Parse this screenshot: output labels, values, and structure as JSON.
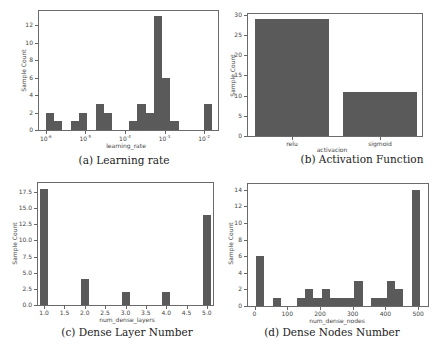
{
  "chart_data": [
    {
      "id": "a",
      "type": "bar",
      "title": "",
      "caption": "(a) Learning rate",
      "xlabel": "learning_rate",
      "ylabel": "Sample Count",
      "xscale": "log",
      "xticks": [
        "10^-6",
        "10^-5",
        "10^-4",
        "10^-3",
        "10^-2"
      ],
      "yticks": [
        0,
        2,
        4,
        6,
        8,
        10,
        12
      ],
      "ylim": [
        0,
        13.6
      ],
      "bins_log10": [
        {
          "x0": -6.0,
          "x1": -5.79,
          "count": 2
        },
        {
          "x0": -5.79,
          "x1": -5.58,
          "count": 1
        },
        {
          "x0": -5.37,
          "x1": -5.16,
          "count": 1
        },
        {
          "x0": -5.16,
          "x1": -4.95,
          "count": 2
        },
        {
          "x0": -4.74,
          "x1": -4.53,
          "count": 3
        },
        {
          "x0": -4.53,
          "x1": -4.32,
          "count": 2
        },
        {
          "x0": -3.9,
          "x1": -3.69,
          "count": 1
        },
        {
          "x0": -3.69,
          "x1": -3.48,
          "count": 3
        },
        {
          "x0": -3.48,
          "x1": -3.27,
          "count": 2
        },
        {
          "x0": -3.27,
          "x1": -3.06,
          "count": 13
        },
        {
          "x0": -3.06,
          "x1": -2.85,
          "count": 6
        },
        {
          "x0": -2.85,
          "x1": -2.64,
          "count": 1
        },
        {
          "x0": -2.0,
          "x1": -1.79,
          "count": 3
        }
      ],
      "grid": false
    },
    {
      "id": "b",
      "type": "bar",
      "caption": "(b) Activation Function",
      "xlabel": "activacion",
      "ylabel": "Sample Count",
      "categories": [
        "relu",
        "sigmoid"
      ],
      "values": [
        29,
        11
      ],
      "yticks": [
        0,
        5,
        10,
        15,
        20,
        25,
        30
      ],
      "ylim": [
        0,
        30
      ],
      "grid": false
    },
    {
      "id": "c",
      "type": "bar",
      "caption": "(c) Dense Layer Number",
      "xlabel": "num_dense_layers",
      "ylabel": "Sample Count",
      "xticks": [
        "1.0",
        "1.5",
        "2.0",
        "2.5",
        "3.0",
        "3.5",
        "4.0",
        "4.5",
        "5.0"
      ],
      "yticks": [
        "0.0",
        "2.5",
        "5.0",
        "7.5",
        "10.0",
        "12.5",
        "15.0",
        "17.5"
      ],
      "x": [
        1,
        2,
        3,
        4,
        5
      ],
      "values": [
        18,
        4,
        2,
        2,
        14
      ],
      "xlim": [
        0.85,
        5.15
      ],
      "ylim": [
        0,
        18.9
      ],
      "grid": false
    },
    {
      "id": "d",
      "type": "bar",
      "caption": "(d) Dense Nodes Number",
      "xlabel": "num_dense_nodes",
      "ylabel": "Sample Count",
      "xticks": [
        "0",
        "100",
        "200",
        "300",
        "400",
        "500"
      ],
      "yticks": [
        0,
        2,
        4,
        6,
        8,
        10,
        12,
        14
      ],
      "xlim": [
        -20,
        530
      ],
      "ylim": [
        0,
        14.7
      ],
      "bins": [
        {
          "x0": 5,
          "x1": 30,
          "count": 6
        },
        {
          "x0": 55,
          "x1": 80,
          "count": 1
        },
        {
          "x0": 130,
          "x1": 155,
          "count": 1
        },
        {
          "x0": 155,
          "x1": 180,
          "count": 2
        },
        {
          "x0": 180,
          "x1": 205,
          "count": 1
        },
        {
          "x0": 205,
          "x1": 230,
          "count": 2
        },
        {
          "x0": 230,
          "x1": 255,
          "count": 1
        },
        {
          "x0": 255,
          "x1": 280,
          "count": 1
        },
        {
          "x0": 280,
          "x1": 305,
          "count": 1
        },
        {
          "x0": 305,
          "x1": 330,
          "count": 3
        },
        {
          "x0": 355,
          "x1": 380,
          "count": 1
        },
        {
          "x0": 380,
          "x1": 405,
          "count": 1
        },
        {
          "x0": 405,
          "x1": 430,
          "count": 3
        },
        {
          "x0": 430,
          "x1": 455,
          "count": 2
        },
        {
          "x0": 480,
          "x1": 505,
          "count": 14
        }
      ],
      "grid": false
    }
  ],
  "colors": {
    "bar": "#5a5a5a",
    "axis": "#6a6a6a",
    "text": "#444444"
  }
}
